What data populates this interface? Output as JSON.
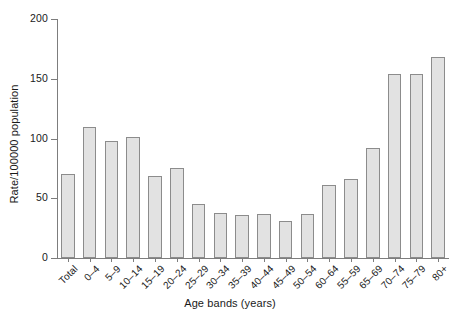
{
  "chart_data": {
    "type": "bar",
    "title": "",
    "xlabel": "Age bands (years)",
    "ylabel": "Rate/100000 population",
    "ylim": [
      0,
      200
    ],
    "yticks": [
      0,
      50,
      100,
      150,
      200
    ],
    "grid": false,
    "legend": null,
    "bar_color": "#e2e2e2",
    "bar_edge_color": "#8c8c8c",
    "axis_color": "#7d7d7d",
    "categories": [
      "Total",
      "0–4",
      "5–9",
      "10–14",
      "15–19",
      "20–24",
      "25–29",
      "30–34",
      "35–39",
      "40–44",
      "45–49",
      "50–54",
      "60–64",
      "55–59",
      "65–69",
      "70–74",
      "75–79",
      "80+"
    ],
    "values": [
      70,
      110,
      98,
      101,
      69,
      75,
      45,
      38,
      36,
      37,
      31,
      37,
      61,
      66,
      92,
      154,
      154,
      168
    ]
  }
}
